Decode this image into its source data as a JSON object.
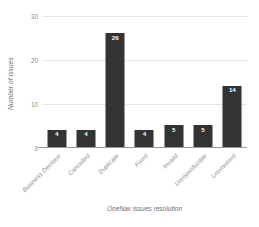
{
  "chart_data": {
    "type": "bar",
    "title": "",
    "xlabel": "OneNav issues resolution",
    "ylabel": "Number of issues",
    "categories": [
      "Business Decision",
      "Cancelled",
      "Duplicate",
      "Fixed",
      "Invalid",
      "Unreproducible",
      "Unresolved"
    ],
    "values": [
      4,
      4,
      26,
      4,
      5,
      5,
      14
    ],
    "data_labels": [
      "4",
      "4",
      "26",
      "4",
      "5",
      "5",
      "14"
    ],
    "ylim": [
      0,
      30
    ],
    "yticks": [
      0,
      10,
      20,
      30
    ],
    "ytick_labels": [
      "0",
      "10",
      "20",
      "30"
    ],
    "grid": "horizontal",
    "legend": "none",
    "bar_color": "#333333",
    "gridline_color": "#e6e6e6",
    "axis_color": "#9a9a9a",
    "data_label_color": "#ffffff",
    "background_color": "#ffffff",
    "xtick_rotation": "-45"
  }
}
